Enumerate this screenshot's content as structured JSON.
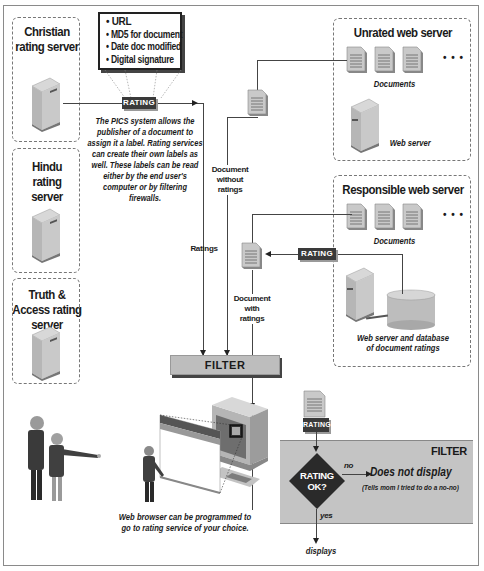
{
  "rating_servers": [
    {
      "name": "Christian rating server"
    },
    {
      "name": "Hindu rating server"
    },
    {
      "name": "Truth & Access rating server"
    }
  ],
  "label_contents": {
    "items": [
      "URL",
      "MD5 for document",
      "Date doc modified",
      "Digital signature"
    ]
  },
  "rating_tag": "RATING",
  "pics_description": "The PICS system allows the publisher of a document to assign it a label. Rating services can create their own labels as well. These labels can be read either by the end user's computer or by filtering firewalls.",
  "unrated_server": {
    "title": "Unrated web server",
    "documents_label": "Documents",
    "server_label": "Web server",
    "ellipsis": "• • •"
  },
  "responsible_server": {
    "title": "Responsible web server",
    "documents_label": "Documents",
    "db_label_line1": "Web server and database",
    "db_label_line2": "of document ratings",
    "ellipsis": "• • •"
  },
  "flow_labels": {
    "document_without_ratings": [
      "Document",
      "without",
      "ratings"
    ],
    "ratings": "Ratings",
    "document_with_ratings": [
      "Document",
      "with",
      "ratings"
    ]
  },
  "filter_bar": {
    "label": "FILTER"
  },
  "browser_caption": {
    "line1": "Web browser can be programmed to",
    "line2": "go to rating service of your choice."
  },
  "filter_panel": {
    "title": "FILTER",
    "decision_line1": "RATING",
    "decision_line2": "OK?",
    "no_label": "no",
    "yes_label": "yes",
    "no_outcome": "Does not display",
    "no_outcome_note": "(Tells mom I tried to do a no-no)",
    "yes_outcome": "displays"
  },
  "colors": {
    "frame": "#8a8a8a",
    "dashed_box": "#777777",
    "filter_gray": "#bdbdbd",
    "filter_panel": "#c4c4c4",
    "rating_tag": "#3a3a3a",
    "diamond": "#2a2a2a"
  }
}
